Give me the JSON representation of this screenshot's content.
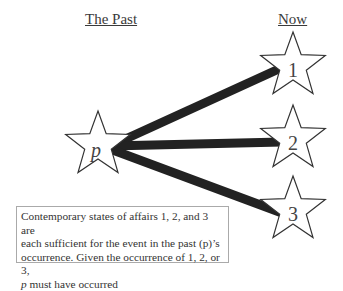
{
  "headings": {
    "past": "The Past",
    "now": "Now"
  },
  "nodes": {
    "past": {
      "label": "p",
      "cx": 98,
      "cy": 145
    },
    "now": [
      {
        "label": "1",
        "cx": 293,
        "cy": 66
      },
      {
        "label": "2",
        "cx": 293,
        "cy": 139
      },
      {
        "label": "3",
        "cx": 293,
        "cy": 210
      }
    ]
  },
  "edges": [
    {
      "from": "p",
      "to": "1"
    },
    {
      "from": "p",
      "to": "2"
    },
    {
      "from": "p",
      "to": "3"
    }
  ],
  "note": {
    "line1": "Contemporary states of affairs  1, 2, and 3 are",
    "line2": "each sufficient for the event in the past (p)’s",
    "line3": "occurrence. Given the occurrence of 1, 2, or 3,",
    "line4_italic": "p",
    "line4_rest": " must have occurred"
  },
  "colors": {
    "edge": "#222222",
    "star_stroke": "#333333",
    "star_fill": "#ffffff"
  }
}
